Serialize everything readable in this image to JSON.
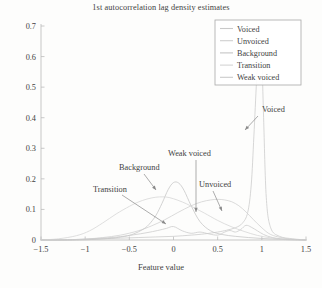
{
  "chart_data": {
    "type": "line",
    "title": "1st autocorrelation lag density estimates",
    "xlabel": "Feature value",
    "ylabel": "",
    "xlim": [
      -1.5,
      1.5
    ],
    "ylim": [
      0,
      0.7
    ],
    "xticks": [
      "−1.5",
      "−1",
      "−0.5",
      "0",
      "0.5",
      "1",
      "1.5"
    ],
    "xtick_values": [
      -1.5,
      -1,
      -0.5,
      0,
      0.5,
      1,
      1.5
    ],
    "yticks": [
      "0",
      "0.1",
      "0.2",
      "0.3",
      "0.4",
      "0.5",
      "0.6",
      "0.7"
    ],
    "ytick_values": [
      0,
      0.1,
      0.2,
      0.3,
      0.4,
      0.5,
      0.6,
      0.7
    ],
    "grid": false,
    "legend_position": "top-right",
    "series": [
      {
        "name": "Voiced",
        "color": "#c9c9c9",
        "x": [
          -1.5,
          -1.2,
          -1.0,
          -0.8,
          -0.6,
          -0.4,
          -0.2,
          0.0,
          0.2,
          0.35,
          0.5,
          0.6,
          0.7,
          0.78,
          0.84,
          0.88,
          0.91,
          0.94,
          0.96,
          0.98,
          1.0,
          1.02,
          1.05,
          1.1,
          1.2,
          1.35,
          1.5
        ],
        "y": [
          0.0,
          0.0,
          0.002,
          0.004,
          0.006,
          0.008,
          0.01,
          0.012,
          0.016,
          0.02,
          0.026,
          0.032,
          0.04,
          0.055,
          0.09,
          0.18,
          0.34,
          0.52,
          0.62,
          0.66,
          0.6,
          0.4,
          0.14,
          0.04,
          0.012,
          0.004,
          0.0
        ]
      },
      {
        "name": "Unvoiced",
        "color": "#cfcfcf",
        "x": [
          -1.5,
          -1.2,
          -1.0,
          -0.8,
          -0.6,
          -0.4,
          -0.25,
          -0.1,
          0.05,
          0.2,
          0.32,
          0.42,
          0.5,
          0.58,
          0.66,
          0.74,
          0.82,
          0.9,
          1.0,
          1.1,
          1.25,
          1.4,
          1.5
        ],
        "y": [
          0.0,
          0.001,
          0.003,
          0.008,
          0.016,
          0.03,
          0.046,
          0.066,
          0.09,
          0.112,
          0.125,
          0.131,
          0.133,
          0.131,
          0.125,
          0.112,
          0.092,
          0.068,
          0.04,
          0.018,
          0.006,
          0.001,
          0.0
        ]
      },
      {
        "name": "Background",
        "color": "#c4c4c4",
        "x": [
          -1.5,
          -1.1,
          -0.9,
          -0.7,
          -0.55,
          -0.45,
          -0.35,
          -0.28,
          -0.2,
          -0.13,
          -0.06,
          0.0,
          0.06,
          0.12,
          0.2,
          0.3,
          0.42,
          0.55,
          0.7,
          0.85,
          1.0,
          1.15,
          1.3,
          1.5
        ],
        "y": [
          0.0,
          0.0,
          0.002,
          0.006,
          0.012,
          0.02,
          0.034,
          0.05,
          0.08,
          0.12,
          0.165,
          0.188,
          0.186,
          0.162,
          0.112,
          0.06,
          0.03,
          0.018,
          0.012,
          0.008,
          0.005,
          0.003,
          0.001,
          0.0
        ]
      },
      {
        "name": "Transition",
        "color": "#d4d4d4",
        "x": [
          -1.5,
          -1.3,
          -1.1,
          -0.95,
          -0.8,
          -0.65,
          -0.5,
          -0.4,
          -0.3,
          -0.2,
          -0.12,
          -0.05,
          0.05,
          0.15,
          0.25,
          0.35,
          0.5,
          0.65,
          0.8,
          0.95,
          1.1,
          1.25,
          1.4,
          1.5
        ],
        "y": [
          0.0,
          0.004,
          0.014,
          0.03,
          0.056,
          0.085,
          0.11,
          0.124,
          0.134,
          0.14,
          0.141,
          0.139,
          0.13,
          0.118,
          0.103,
          0.088,
          0.064,
          0.044,
          0.028,
          0.015,
          0.007,
          0.002,
          0.0,
          0.0
        ]
      },
      {
        "name": "Weak voiced",
        "color": "#cacaca",
        "x": [
          -1.5,
          -1.2,
          -1.0,
          -0.8,
          -0.6,
          -0.45,
          -0.3,
          -0.18,
          -0.08,
          0.0,
          0.1,
          0.2,
          0.3,
          0.4,
          0.5,
          0.58,
          0.64,
          0.7,
          0.76,
          0.82,
          0.88,
          0.95,
          1.02,
          1.12,
          1.25,
          1.4,
          1.5
        ],
        "y": [
          0.0,
          0.001,
          0.003,
          0.006,
          0.011,
          0.017,
          0.024,
          0.031,
          0.038,
          0.044,
          0.03,
          0.022,
          0.026,
          0.02,
          0.016,
          0.026,
          0.031,
          0.026,
          0.034,
          0.048,
          0.042,
          0.03,
          0.018,
          0.008,
          0.003,
          0.001,
          0.0
        ]
      }
    ],
    "legend_entries": [
      "Voiced",
      "Unvoiced",
      "Background",
      "Transition",
      "Weak voiced"
    ],
    "annotations": [
      {
        "label": "Voiced",
        "text_x": 262,
        "text_y": 112,
        "arrow_from_x": 258,
        "arrow_from_y": 116,
        "arrow_to_x": 245,
        "arrow_to_y": 130
      },
      {
        "label": "Unvoiced",
        "text_x": 199,
        "text_y": 187,
        "arrow_from_x": 213,
        "arrow_from_y": 191,
        "arrow_to_x": 222,
        "arrow_to_y": 211
      },
      {
        "label": "Weak voiced",
        "text_x": 168,
        "text_y": 156,
        "arrow_from_x": 196,
        "arrow_from_y": 160,
        "arrow_to_x": 196,
        "arrow_to_y": 212
      },
      {
        "label": "Background",
        "text_x": 119,
        "text_y": 170,
        "arrow_from_x": 144,
        "arrow_from_y": 174,
        "arrow_to_x": 156,
        "arrow_to_y": 190
      },
      {
        "label": "Transition",
        "text_x": 93,
        "text_y": 192,
        "arrow_from_x": 122,
        "arrow_from_y": 195,
        "arrow_to_x": 166,
        "arrow_to_y": 224
      }
    ]
  }
}
